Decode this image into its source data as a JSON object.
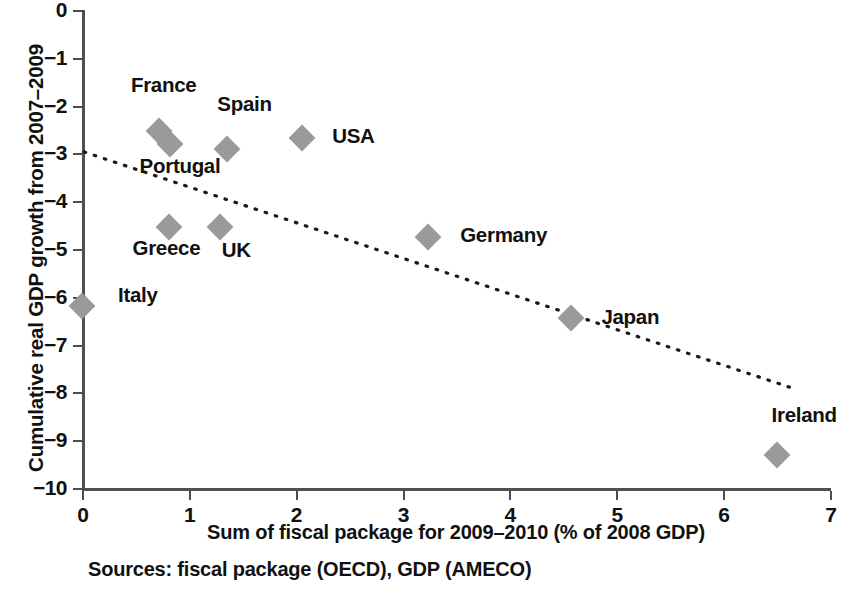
{
  "chart_data": {
    "type": "scatter",
    "title": "",
    "xlabel": "Sum of fiscal package for 2009–2010 (% of 2008 GDP)",
    "ylabel": "Cumulative real GDP growth from 2007–2009",
    "xlim": [
      0,
      7
    ],
    "ylim": [
      -10,
      0
    ],
    "xticks": [
      0,
      1,
      2,
      3,
      4,
      5,
      6,
      7
    ],
    "xtick_labels": [
      "0",
      "1",
      "2",
      "3",
      "4",
      "5",
      "6",
      "7"
    ],
    "yticks": [
      0,
      -1,
      -2,
      -3,
      -4,
      -5,
      -6,
      -7,
      -8,
      -9,
      -10
    ],
    "ytick_labels": [
      "0",
      "−1",
      "−2",
      "−3",
      "−4",
      "−5",
      "−6",
      "−7",
      "−8",
      "−9",
      "−10"
    ],
    "grid": false,
    "legend": "none",
    "marker_color": "#9a9a9a",
    "marker_shape": "diamond",
    "points": [
      {
        "label": "Italy",
        "x": 0.0,
        "y": -6.2,
        "label_dx": 36,
        "label_dy": -11
      },
      {
        "label": "France",
        "x": 0.72,
        "y": -2.53,
        "label_dx": -28,
        "label_dy": -46
      },
      {
        "label": "Portugal",
        "x": 0.82,
        "y": -2.8,
        "label_dx": -30,
        "label_dy": 22
      },
      {
        "label": "Greece",
        "x": 0.81,
        "y": -4.55,
        "label_dx": -36,
        "label_dy": 21
      },
      {
        "label": "UK",
        "x": 1.29,
        "y": -4.53,
        "label_dx": 2,
        "label_dy": 23
      },
      {
        "label": "Spain",
        "x": 1.36,
        "y": -2.9,
        "label_dx": -10,
        "label_dy": -45
      },
      {
        "label": "USA",
        "x": 2.06,
        "y": -2.67,
        "label_dx": 30,
        "label_dy": -2
      },
      {
        "label": "Germany",
        "x": 3.24,
        "y": -4.75,
        "label_dx": 32,
        "label_dy": -2
      },
      {
        "label": "Japan",
        "x": 4.58,
        "y": -6.45,
        "label_dx": 30,
        "label_dy": -1
      },
      {
        "label": "Ireland",
        "x": 6.5,
        "y": -9.3,
        "label_dx": -5,
        "label_dy": -40
      }
    ],
    "trendline": {
      "style": "dotted",
      "color": "#1a1a1a",
      "x_start": 0.02,
      "y_start": -2.97,
      "x_end": 6.62,
      "y_end": -7.89
    },
    "source_note": "Sources: fiscal package (OECD), GDP (AMECO)"
  }
}
